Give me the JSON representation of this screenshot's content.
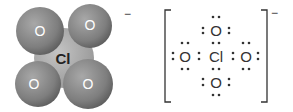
{
  "space_filling_model": {
    "central_atom": "Cl",
    "ligand_atoms": [
      "O",
      "O",
      "O",
      "O"
    ],
    "charge": "−",
    "colors": {
      "oxygen": "#8a8a8a",
      "chlorine": "#b3b3b3",
      "label_light": "#ffffff",
      "label_dark": "#222222"
    }
  },
  "lewis_structure": {
    "central_atom": "Cl",
    "top": "O",
    "left": "O",
    "right": "O",
    "bottom": "O",
    "charge": "−",
    "colors": {
      "ink": "#333333"
    }
  }
}
